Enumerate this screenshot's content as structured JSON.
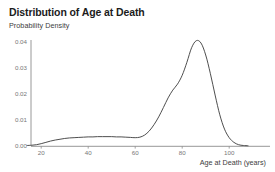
{
  "chart_data": {
    "type": "line",
    "title": "Distribution of Age at Death",
    "subtitle": "Probability Density",
    "ylabel": "Probability Density",
    "xlabel": "Age at Death (years)",
    "xticklabels": [
      "20",
      "40",
      "60",
      "80",
      "100"
    ],
    "xticks": [
      20,
      40,
      60,
      80,
      100
    ],
    "yticklabels": [
      "0.00",
      "0.01",
      "0.02",
      "0.03",
      "0.04"
    ],
    "yticks": [
      0.0,
      0.01,
      0.02,
      0.03,
      0.04
    ],
    "xlim": [
      14,
      108
    ],
    "ylim": [
      0.0,
      0.042
    ],
    "grid": false,
    "legend": false,
    "line_color": "#444444",
    "axis_color": "#8c8c8c",
    "background": "#ffffff",
    "series": [
      {
        "name": "Age at Death density",
        "x": [
          14,
          16,
          18,
          20,
          22,
          24,
          26,
          28,
          30,
          32,
          34,
          36,
          38,
          40,
          42,
          44,
          46,
          48,
          50,
          52,
          54,
          56,
          58,
          60,
          62,
          64,
          66,
          68,
          70,
          72,
          74,
          76,
          78,
          80,
          82,
          84,
          86,
          88,
          90,
          92,
          94,
          96,
          98,
          100,
          102,
          104,
          106,
          108
        ],
        "values": [
          0.0002,
          0.0003,
          0.0005,
          0.0009,
          0.0014,
          0.0019,
          0.0023,
          0.0026,
          0.0029,
          0.0031,
          0.0032,
          0.0033,
          0.0034,
          0.0035,
          0.0035,
          0.0036,
          0.0036,
          0.0036,
          0.0036,
          0.0035,
          0.0035,
          0.0034,
          0.0033,
          0.0032,
          0.0034,
          0.0042,
          0.0058,
          0.0082,
          0.0112,
          0.0148,
          0.0185,
          0.0215,
          0.0238,
          0.0272,
          0.0322,
          0.0378,
          0.0405,
          0.0396,
          0.035,
          0.0278,
          0.0196,
          0.012,
          0.0065,
          0.0032,
          0.0014,
          0.0005,
          0.0002,
          0.0001
        ]
      }
    ]
  }
}
